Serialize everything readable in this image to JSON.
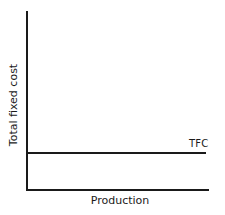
{
  "chart_data": {
    "type": "line",
    "title": "",
    "xlabel": "Production",
    "ylabel": "Total fixed cost",
    "x_ticks": [],
    "y_ticks": [],
    "grid": false,
    "legend": null,
    "series": [
      {
        "name": "TFC",
        "description": "Horizontal line: total fixed cost is constant regardless of production level",
        "x": [
          0,
          1
        ],
        "values": [
          0.2,
          0.2
        ]
      }
    ],
    "annotations": [
      {
        "text": "TFC",
        "position": "right end of line, above"
      }
    ],
    "xlim": [
      0,
      1
    ],
    "ylim": [
      0,
      1
    ]
  },
  "labels": {
    "x_axis": "Production",
    "y_axis": "Total fixed cost",
    "series_label": "TFC"
  }
}
